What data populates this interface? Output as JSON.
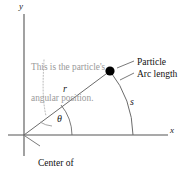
{
  "figure": {
    "background_color": "#ffffff",
    "line_color": "#555555",
    "axis_color": "#4d4d4d",
    "annotation_color": "#9a9a9a",
    "text_color": "#111111",
    "particle_color": "#000000"
  },
  "axes": {
    "y_label": "y",
    "x_label": "x",
    "origin": {
      "x": 24,
      "y": 135
    }
  },
  "variables": {
    "radius_label": "r",
    "arc_label": "s",
    "angle_label": "θ"
  },
  "callouts": {
    "particle": "Particle",
    "arc_length": "Arc length",
    "center_line1": "Center of",
    "center_line2": "circular motion"
  },
  "annotation": {
    "line1": "This is the particle's",
    "line2": "angular position."
  },
  "geometry": {
    "particle_point": {
      "x": 110,
      "y": 71
    },
    "radius_length": 102,
    "angle_degrees": 39,
    "arc_radius": 109,
    "arc_x_intercept": {
      "x": 133,
      "y": 135
    }
  }
}
